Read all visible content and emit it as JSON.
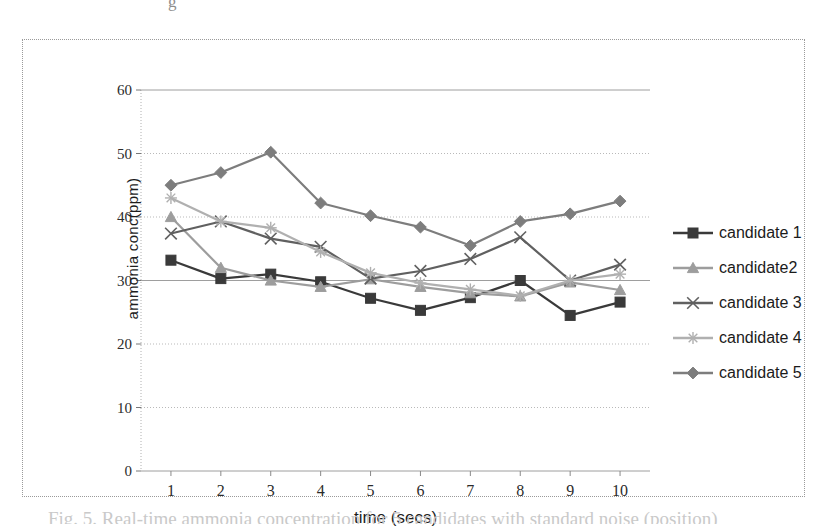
{
  "figure": {
    "top_partial_text": "g",
    "bottom_partial_caption": "Fig. 5. Real-time ammonia concentration for 5 candidates with standard noise (position)"
  },
  "axes": {
    "y_title": "ammonia  conc(ppm)",
    "x_title": "time (secs)",
    "y_ticks": [
      "0",
      "10",
      "20",
      "30",
      "40",
      "50",
      "60"
    ],
    "x_ticks": [
      "1",
      "2",
      "3",
      "4",
      "5",
      "6",
      "7",
      "8",
      "9",
      "10"
    ]
  },
  "legend": {
    "items": [
      {
        "label": "candidate 1",
        "marker": "square-marker",
        "color": "#3a3a3a"
      },
      {
        "label": "candidate2",
        "marker": "triangle-marker",
        "color": "#9d9d9d"
      },
      {
        "label": "candidate 3",
        "marker": "cross-marker",
        "color": "#606060"
      },
      {
        "label": "candidate 4",
        "marker": "star-marker",
        "color": "#b0b0b0"
      },
      {
        "label": "candidate 5",
        "marker": "diamond-marker",
        "color": "#7d7d7d"
      }
    ]
  },
  "chart_data": {
    "type": "line",
    "title": "",
    "xlabel": "time (secs)",
    "ylabel": "ammonia  conc(ppm)",
    "x": [
      1,
      2,
      3,
      4,
      5,
      6,
      7,
      8,
      9,
      10
    ],
    "xlim": [
      0.4,
      10.6
    ],
    "ylim": [
      0,
      60
    ],
    "y_tick_step": 10,
    "grid": true,
    "legend_position": "right",
    "series": [
      {
        "name": "candidate 1",
        "marker": "square",
        "color": "#3a3a3a",
        "values": [
          33.2,
          30.3,
          31.0,
          29.8,
          27.2,
          25.3,
          27.3,
          30.0,
          24.5,
          26.6
        ]
      },
      {
        "name": "candidate2",
        "marker": "triangle",
        "color": "#9d9d9d",
        "values": [
          40.0,
          32.0,
          30.0,
          29.0,
          30.2,
          29.0,
          28.0,
          27.5,
          29.7,
          28.5
        ]
      },
      {
        "name": "candidate 3",
        "marker": "cross",
        "color": "#606060",
        "values": [
          37.4,
          39.3,
          36.6,
          35.3,
          30.3,
          31.5,
          33.4,
          36.8,
          30.0,
          32.5
        ]
      },
      {
        "name": "candidate 4",
        "marker": "star",
        "color": "#b0b0b0",
        "values": [
          43.0,
          39.3,
          38.3,
          34.5,
          31.2,
          29.6,
          28.6,
          27.6,
          30.0,
          31.0
        ]
      },
      {
        "name": "candidate 5",
        "marker": "diamond",
        "color": "#7d7d7d",
        "values": [
          45.0,
          47.0,
          50.2,
          42.2,
          40.2,
          38.4,
          35.5,
          39.3,
          40.5,
          42.5
        ]
      }
    ]
  }
}
